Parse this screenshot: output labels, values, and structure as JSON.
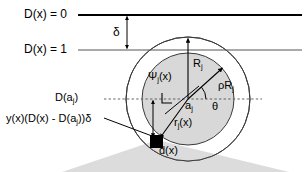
{
  "figure": {
    "type": "geometric-diagram",
    "background": "#ffffff",
    "width": 307,
    "height": 172,
    "colors": {
      "stroke": "#000000",
      "thin_line": "#555555",
      "inner_disk_fill": "#d8d8d8",
      "cone_fill": "#dcdcdc",
      "dashed": "#555555"
    }
  },
  "labels": {
    "d_equals_zero": "D(x) = 0",
    "d_equals_one": "D(x) = 1",
    "delta": "δ",
    "d_of_aj": "D(a",
    "d_of_aj_sub": "j",
    "d_of_aj_tail": ")",
    "offset_expression_1": "y(x)(D(x) - D(a",
    "offset_expression_sub": "j",
    "offset_expression_2": "))δ",
    "radius_outer": "R",
    "radius_outer_sub": "j",
    "radius_inner": "ρR",
    "radius_inner_sub": "j",
    "psi": "Ψ",
    "psi_sub": "j",
    "psi_tail": "(x)",
    "center_point": "a",
    "center_point_sub": "j",
    "theta": "θ",
    "r_of_x": "r",
    "r_of_x_sub": "j",
    "r_of_x_tail": "(x)",
    "d_of_x_point": "d(x)"
  },
  "geometry": {
    "line_d0_y": 15,
    "line_d1_y": 50,
    "dashed_line_y": 99,
    "center_x": 188,
    "center_y": 99,
    "outer_radius": 62,
    "inner_radius": 46,
    "delta_arrow_x": 127,
    "point_x": 157,
    "point_y": 142
  }
}
